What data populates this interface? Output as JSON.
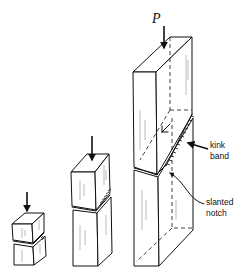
{
  "figure": {
    "load_symbol": "P",
    "annotations": {
      "kink_band": [
        "kink",
        "band"
      ],
      "slanted_notch": [
        "slanted",
        "notch"
      ]
    },
    "specimens": [
      {
        "name": "small",
        "has_load_arrow": true,
        "has_kink_band": true,
        "has_notch": true
      },
      {
        "name": "medium",
        "has_load_arrow": true,
        "has_kink_band": true,
        "has_notch": true
      },
      {
        "name": "large",
        "has_load_arrow": true,
        "has_kink_band": true,
        "has_notch": true
      }
    ],
    "colors": {
      "ink": "#111111",
      "background": "#ffffff"
    }
  }
}
